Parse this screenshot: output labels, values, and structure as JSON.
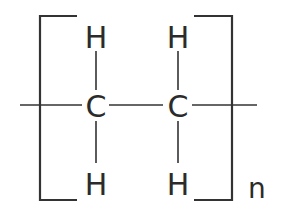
{
  "diagram": {
    "type": "chemical-structure",
    "atoms": [
      {
        "id": "C1",
        "label": "C",
        "x": 96,
        "y": 117
      },
      {
        "id": "C2",
        "label": "C",
        "x": 178,
        "y": 117
      },
      {
        "id": "H1",
        "label": "H",
        "x": 96,
        "y": 48
      },
      {
        "id": "H2",
        "label": "H",
        "x": 178,
        "y": 48
      },
      {
        "id": "H3",
        "label": "H",
        "x": 96,
        "y": 195
      },
      {
        "id": "H4",
        "label": "H",
        "x": 178,
        "y": 195
      }
    ],
    "bonds": [
      {
        "from": "C1",
        "to": "C2"
      },
      {
        "from": "C1",
        "to": "H1"
      },
      {
        "from": "C1",
        "to": "H3"
      },
      {
        "from": "C2",
        "to": "H2"
      },
      {
        "from": "C2",
        "to": "H4"
      },
      {
        "from": "left-chain",
        "to": "C1"
      },
      {
        "from": "C2",
        "to": "right-chain"
      }
    ],
    "repeat_subscript": "n",
    "colors": {
      "ink": "#2b2b2b",
      "background": "#ffffff"
    }
  }
}
